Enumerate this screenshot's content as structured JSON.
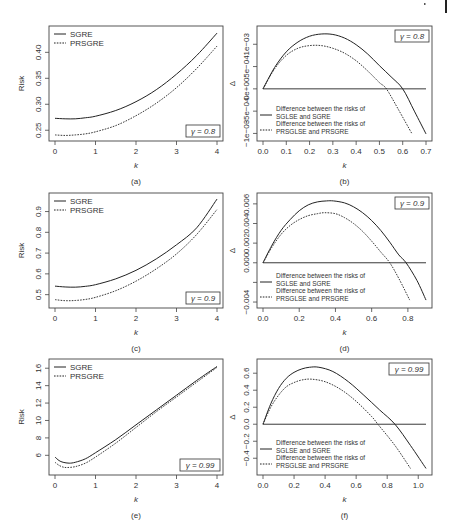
{
  "page_marks": {
    "corner_bar": true
  },
  "chart_data": [
    {
      "id": "a",
      "caption": "(a)",
      "type": "line",
      "xlabel": "k",
      "ylabel": "Risk",
      "xlim": [
        0,
        4
      ],
      "ylim": [
        0.237,
        0.443
      ],
      "xticks": [
        0,
        1,
        2,
        3,
        4
      ],
      "xtick_labels": [
        "0",
        "1",
        "2",
        "3",
        "4"
      ],
      "yticks": [
        0.25,
        0.3,
        0.35,
        0.4
      ],
      "ytick_labels": [
        "0.25",
        "0.30",
        "0.35",
        "0.40"
      ],
      "annotation": "γ = 0.8",
      "legend_position": "top-left",
      "series": [
        {
          "name": "SGRE",
          "style": "solid",
          "x": [
            0,
            0.25,
            0.5,
            0.75,
            1,
            1.5,
            2,
            2.5,
            3,
            3.5,
            4
          ],
          "y": [
            0.273,
            0.272,
            0.272,
            0.274,
            0.277,
            0.288,
            0.305,
            0.328,
            0.358,
            0.394,
            0.437
          ]
        },
        {
          "name": "PRSGRE",
          "style": "dotted",
          "x": [
            0,
            0.25,
            0.5,
            0.75,
            1,
            1.5,
            2,
            2.5,
            3,
            3.5,
            4
          ],
          "y": [
            0.241,
            0.24,
            0.241,
            0.243,
            0.247,
            0.259,
            0.278,
            0.302,
            0.332,
            0.369,
            0.412
          ]
        }
      ]
    },
    {
      "id": "b",
      "caption": "(b)",
      "type": "line",
      "xlabel": "k",
      "ylabel": "Δ",
      "xlim": [
        0,
        0.7
      ],
      "ylim": [
        -0.00108,
        0.00132
      ],
      "xticks": [
        0,
        0.1,
        0.2,
        0.3,
        0.4,
        0.5,
        0.6,
        0.7
      ],
      "xtick_labels": [
        "0.0",
        "0.1",
        "0.2",
        "0.3",
        "0.4",
        "0.5",
        "0.6",
        "0.7"
      ],
      "yticks": [
        -0.001,
        -0.0005,
        0,
        0.0005,
        0.001
      ],
      "ytick_labels": [
        "−1e−03",
        "−5e−04",
        "0e+00",
        "5e−04",
        "1e−03"
      ],
      "annotation": "γ = 0.8",
      "legend_position": "bottom-left",
      "hline": 0,
      "series": [
        {
          "name": "Difference between the risks of SGLSE and SGRE",
          "line1": "Difference between the risks of",
          "line2": "SGLSE and SGRE",
          "style": "solid",
          "x": [
            0,
            0.05,
            0.1,
            0.15,
            0.2,
            0.25,
            0.3,
            0.35,
            0.4,
            0.45,
            0.5,
            0.55,
            0.6,
            0.65,
            0.7
          ],
          "y": [
            0,
            0.00048,
            0.00083,
            0.00105,
            0.00118,
            0.00123,
            0.00122,
            0.00114,
            0.00099,
            0.00078,
            0.00052,
            0.00027,
            0,
            -0.0005,
            -0.00101
          ]
        },
        {
          "name": "Difference between the risks of PRSGLSE and PRSGRE",
          "line1": "Difference between the risks of",
          "line2": "PRSGLSE and PRSGRE",
          "style": "dotted",
          "x": [
            0,
            0.05,
            0.1,
            0.15,
            0.2,
            0.25,
            0.3,
            0.35,
            0.4,
            0.45,
            0.5,
            0.53,
            0.58,
            0.64
          ],
          "y": [
            0,
            0.00045,
            0.00075,
            0.00091,
            0.00097,
            0.00097,
            0.00091,
            0.0008,
            0.00063,
            0.0004,
            0.00014,
            0,
            -0.00045,
            -0.00101
          ]
        }
      ]
    },
    {
      "id": "c",
      "caption": "(c)",
      "type": "line",
      "xlabel": "k",
      "ylabel": "Risk",
      "xlim": [
        0,
        4
      ],
      "ylim": [
        0.455,
        0.97
      ],
      "xticks": [
        0,
        1,
        2,
        3,
        4
      ],
      "xtick_labels": [
        "0",
        "1",
        "2",
        "3",
        "4"
      ],
      "yticks": [
        0.5,
        0.6,
        0.7,
        0.8,
        0.9
      ],
      "ytick_labels": [
        "0.5",
        "0.6",
        "0.7",
        "0.8",
        "0.9"
      ],
      "annotation": "γ = 0.9",
      "legend_position": "top-left",
      "series": [
        {
          "name": "SGRE",
          "style": "solid",
          "x": [
            0,
            0.25,
            0.5,
            0.75,
            1,
            1.5,
            2,
            2.5,
            3,
            3.5,
            4
          ],
          "y": [
            0.541,
            0.537,
            0.536,
            0.54,
            0.548,
            0.576,
            0.617,
            0.672,
            0.74,
            0.822,
            0.96
          ]
        },
        {
          "name": "PRSGRE",
          "style": "dotted",
          "x": [
            0,
            0.25,
            0.5,
            0.75,
            1,
            1.5,
            2,
            2.5,
            3,
            3.5,
            4
          ],
          "y": [
            0.476,
            0.471,
            0.472,
            0.477,
            0.487,
            0.519,
            0.565,
            0.624,
            0.696,
            0.79,
            0.91
          ]
        }
      ]
    },
    {
      "id": "d",
      "caption": "(d)",
      "type": "line",
      "xlabel": "k",
      "ylabel": "Δ",
      "xlim": [
        0,
        0.9
      ],
      "ylim": [
        -0.0042,
        0.0067
      ],
      "xticks": [
        0,
        0.2,
        0.4,
        0.6,
        0.8
      ],
      "xtick_labels": [
        "0.0",
        "0.2",
        "0.4",
        "0.6",
        "0.8"
      ],
      "yticks": [
        -0.004,
        -0.002,
        0,
        0.002,
        0.004,
        0.006
      ],
      "ytick_labels": [
        "−0.004",
        "",
        "0.000",
        "0.002",
        "0.004",
        "0.006"
      ],
      "annotation": "γ = 0.9",
      "legend_position": "bottom-left",
      "hline": 0,
      "series": [
        {
          "name": "Difference between the risks of SGLSE and SGRE",
          "line1": "Difference between the risks of",
          "line2": "SGLSE and SGRE",
          "style": "solid",
          "x": [
            0,
            0.05,
            0.1,
            0.15,
            0.2,
            0.25,
            0.3,
            0.35,
            0.39,
            0.45,
            0.5,
            0.55,
            0.6,
            0.65,
            0.7,
            0.75,
            0.79,
            0.85,
            0.9
          ],
          "y": [
            0,
            0.0018,
            0.0033,
            0.0044,
            0.0053,
            0.0059,
            0.0062,
            0.0063,
            0.0063,
            0.0061,
            0.0057,
            0.0051,
            0.0043,
            0.0033,
            0.0021,
            0.0008,
            0,
            -0.0018,
            -0.0038
          ]
        },
        {
          "name": "Difference between the risks of PRSGLSE and PRSGRE",
          "line1": "Difference between the risks of",
          "line2": "PRSGLSE and PRSGRE",
          "style": "dotted",
          "x": [
            0,
            0.05,
            0.1,
            0.15,
            0.2,
            0.25,
            0.3,
            0.34,
            0.4,
            0.45,
            0.5,
            0.55,
            0.6,
            0.65,
            0.7,
            0.75,
            0.81
          ],
          "y": [
            0,
            0.0016,
            0.0029,
            0.0038,
            0.0044,
            0.0048,
            0.005,
            0.0051,
            0.005,
            0.0046,
            0.004,
            0.0032,
            0.0022,
            0.0011,
            0,
            -0.0016,
            -0.0038
          ]
        }
      ]
    },
    {
      "id": "e",
      "caption": "(e)",
      "type": "line",
      "xlabel": "k",
      "ylabel": "Risk",
      "xlim": [
        0,
        4
      ],
      "ylim": [
        4.2,
        16.6
      ],
      "xticks": [
        0,
        1,
        2,
        3,
        4
      ],
      "xtick_labels": [
        "0",
        "1",
        "2",
        "3",
        "4"
      ],
      "yticks": [
        6,
        8,
        10,
        12,
        14,
        16
      ],
      "ytick_labels": [
        "6",
        "8",
        "10",
        "12",
        "14",
        "16"
      ],
      "annotation": "γ = 0.99",
      "legend_position": "top-left",
      "series": [
        {
          "name": "SGRE",
          "style": "solid",
          "x": [
            0,
            0.1,
            0.2,
            0.35,
            0.5,
            0.75,
            1,
            1.5,
            2,
            2.5,
            3,
            3.5,
            4
          ],
          "y": [
            5.8,
            5.4,
            5.2,
            5.1,
            5.2,
            5.6,
            6.3,
            7.8,
            9.5,
            11.2,
            12.9,
            14.6,
            16.2
          ]
        },
        {
          "name": "PRSGRE",
          "style": "dotted",
          "x": [
            0,
            0.1,
            0.2,
            0.3,
            0.5,
            0.75,
            1,
            1.5,
            2,
            2.5,
            3,
            3.5,
            4
          ],
          "y": [
            5.2,
            4.85,
            4.65,
            4.6,
            4.7,
            5.1,
            5.8,
            7.4,
            9.2,
            11.0,
            12.7,
            14.4,
            16.1
          ]
        }
      ]
    },
    {
      "id": "f",
      "caption": "(f)",
      "type": "line",
      "xlabel": "k",
      "ylabel": "Δ",
      "xlim": [
        0,
        1.05
      ],
      "ylim": [
        -0.55,
        0.72
      ],
      "xticks": [
        0,
        0.2,
        0.4,
        0.6,
        0.8,
        1.0
      ],
      "xtick_labels": [
        "0.0",
        "0.2",
        "0.4",
        "0.6",
        "0.8",
        "1.0"
      ],
      "yticks": [
        -0.4,
        -0.2,
        0,
        0.2,
        0.4,
        0.6
      ],
      "ytick_labels": [
        "−0.4",
        "−0.2",
        "0.0",
        "0.2",
        "0.4",
        "0.6"
      ],
      "annotation": "γ = 0.99",
      "legend_position": "bottom-left",
      "hline": 0,
      "series": [
        {
          "name": "Difference between the risks of SGLSE and SGRE",
          "line1": "Difference between the risks of",
          "line2": "SGLSE and SGRE",
          "style": "solid",
          "x": [
            0,
            0.05,
            0.1,
            0.15,
            0.2,
            0.25,
            0.3,
            0.36,
            0.45,
            0.55,
            0.65,
            0.75,
            0.85,
            0.95,
            1.05
          ],
          "y": [
            0,
            0.24,
            0.42,
            0.54,
            0.61,
            0.65,
            0.67,
            0.67,
            0.62,
            0.5,
            0.34,
            0.17,
            0,
            -0.25,
            -0.52
          ]
        },
        {
          "name": "Difference between the risks of PRSGLSE and PRSGRE",
          "line1": "Difference between the risks of",
          "line2": "PRSGLSE and PRSGRE",
          "style": "dotted",
          "x": [
            0,
            0.05,
            0.1,
            0.15,
            0.2,
            0.25,
            0.31,
            0.4,
            0.5,
            0.6,
            0.7,
            0.74,
            0.85,
            0.95
          ],
          "y": [
            0,
            0.2,
            0.34,
            0.44,
            0.49,
            0.52,
            0.53,
            0.5,
            0.41,
            0.27,
            0.09,
            0,
            -0.25,
            -0.52
          ]
        }
      ]
    }
  ]
}
